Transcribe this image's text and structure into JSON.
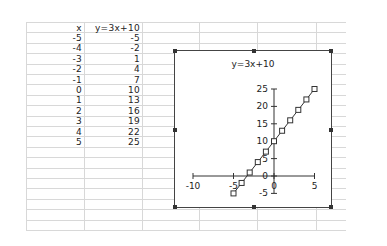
{
  "sheet": {
    "headers": {
      "x": "x",
      "y": "y=3x+10"
    },
    "rows": [
      {
        "x": "-5",
        "y": "-5"
      },
      {
        "x": "-4",
        "y": "-2"
      },
      {
        "x": "-3",
        "y": "1"
      },
      {
        "x": "-2",
        "y": "4"
      },
      {
        "x": "-1",
        "y": "7"
      },
      {
        "x": "0",
        "y": "10"
      },
      {
        "x": "1",
        "y": "13"
      },
      {
        "x": "2",
        "y": "16"
      },
      {
        "x": "3",
        "y": "19"
      },
      {
        "x": "4",
        "y": "22"
      },
      {
        "x": "5",
        "y": "25"
      }
    ]
  },
  "chart": {
    "title": "y=3x+10",
    "x_ticks": [
      "-10",
      "-5",
      "0",
      "5"
    ],
    "y_ticks": [
      "-5",
      "0",
      "5",
      "10",
      "15",
      "20",
      "25"
    ],
    "line_color": "#333333",
    "marker": "hollow-square"
  },
  "chart_data": {
    "type": "scatter",
    "title": "y=3x+10",
    "xlabel": "",
    "ylabel": "",
    "x": [
      -5,
      -4,
      -3,
      -2,
      -1,
      0,
      1,
      2,
      3,
      4,
      5
    ],
    "series": [
      {
        "name": "y=3x+10",
        "values": [
          -5,
          -2,
          1,
          4,
          7,
          10,
          13,
          16,
          19,
          22,
          25
        ]
      }
    ],
    "xlim": [
      -10,
      5
    ],
    "ylim": [
      -5,
      25
    ],
    "x_tick_labels": [
      "-10",
      "-5",
      "0",
      "5"
    ],
    "y_tick_labels": [
      "-5",
      "0",
      "5",
      "10",
      "15",
      "20",
      "25"
    ],
    "grid": false,
    "legend": "none",
    "markers": "hollow squares connected by lines"
  }
}
